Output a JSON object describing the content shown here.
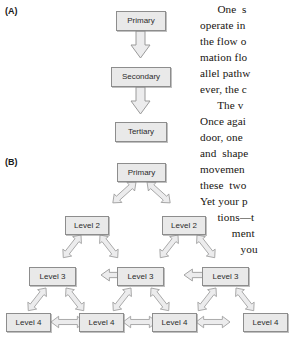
{
  "figure": {
    "panels": [
      {
        "id": "A",
        "label": "(A)"
      },
      {
        "id": "B",
        "label": "(B)"
      }
    ]
  },
  "panel_a": {
    "label": "(A)",
    "type": "serial-hierarchy-flowchart",
    "nodes": [
      {
        "id": "a-primary",
        "label": "Primary"
      },
      {
        "id": "a-secondary",
        "label": "Secondary"
      },
      {
        "id": "a-tertiary",
        "label": "Tertiary"
      }
    ],
    "connectors": [
      {
        "id": "a-arrow-1",
        "from": "a-primary",
        "to": "a-secondary",
        "style": "single-headed-down-block-arrow"
      },
      {
        "id": "a-arrow-2",
        "from": "a-secondary",
        "to": "a-tertiary",
        "style": "single-headed-down-block-arrow"
      }
    ]
  },
  "panel_b": {
    "label": "(B)",
    "type": "distributed-hierarchy-network",
    "nodes": [
      {
        "id": "b-primary",
        "label": "Primary"
      },
      {
        "id": "b-l2-left",
        "label": "Level 2"
      },
      {
        "id": "b-l2-right",
        "label": "Level 2"
      },
      {
        "id": "b-l3-left",
        "label": "Level 3"
      },
      {
        "id": "b-l3-mid",
        "label": "Level 3"
      },
      {
        "id": "b-l3-right",
        "label": "Level 3"
      },
      {
        "id": "b-l4-1",
        "label": "Level 4"
      },
      {
        "id": "b-l4-2",
        "label": "Level 4"
      },
      {
        "id": "b-l4-3",
        "label": "Level 4"
      },
      {
        "id": "b-l4-4",
        "label": "Level 4"
      }
    ],
    "connectors": [
      {
        "id": "b-arrow-p-l2l",
        "from": "b-primary",
        "to": "b-l2-left",
        "style": "double-headed-block-arrow"
      },
      {
        "id": "b-arrow-p-l2r",
        "from": "b-primary",
        "to": "b-l2-right",
        "style": "double-headed-block-arrow"
      },
      {
        "id": "b-arrow-l2l-l3l",
        "from": "b-l2-left",
        "to": "b-l3-left",
        "style": "double-headed-block-arrow"
      },
      {
        "id": "b-arrow-l2l-l3m",
        "from": "b-l2-left",
        "to": "b-l3-mid",
        "style": "double-headed-block-arrow"
      },
      {
        "id": "b-arrow-l2r-l3m",
        "from": "b-l2-right",
        "to": "b-l3-mid",
        "style": "double-headed-block-arrow"
      },
      {
        "id": "b-arrow-l2r-l3r",
        "from": "b-l2-right",
        "to": "b-l3-right",
        "style": "double-headed-block-arrow"
      },
      {
        "id": "b-arrow-l3l-l3m",
        "from": "b-l3-left",
        "to": "b-l3-mid",
        "style": "double-headed-block-arrow"
      },
      {
        "id": "b-arrow-l3m-l3r",
        "from": "b-l3-mid",
        "to": "b-l3-right",
        "style": "double-headed-block-arrow"
      },
      {
        "id": "b-arrow-l3l-l41",
        "from": "b-l3-left",
        "to": "b-l4-1",
        "style": "double-headed-block-arrow"
      },
      {
        "id": "b-arrow-l3l-l42",
        "from": "b-l3-left",
        "to": "b-l4-2",
        "style": "double-headed-block-arrow"
      },
      {
        "id": "b-arrow-l3m-l42",
        "from": "b-l3-mid",
        "to": "b-l4-2",
        "style": "double-headed-block-arrow"
      },
      {
        "id": "b-arrow-l3m-l43",
        "from": "b-l3-mid",
        "to": "b-l4-3",
        "style": "double-headed-block-arrow"
      },
      {
        "id": "b-arrow-l3r-l43",
        "from": "b-l3-right",
        "to": "b-l4-3",
        "style": "double-headed-block-arrow"
      },
      {
        "id": "b-arrow-l3r-l44",
        "from": "b-l3-right",
        "to": "b-l4-4",
        "style": "double-headed-block-arrow"
      },
      {
        "id": "b-arrow-l41-l42",
        "from": "b-l4-1",
        "to": "b-l4-2",
        "style": "double-headed-block-arrow"
      },
      {
        "id": "b-arrow-l42-l43",
        "from": "b-l4-2",
        "to": "b-l4-3",
        "style": "double-headed-block-arrow"
      },
      {
        "id": "b-arrow-l43-l44",
        "from": "b-l4-3",
        "to": "b-l4-4",
        "style": "double-headed-block-arrow"
      }
    ]
  },
  "body_text": {
    "note": "right-hand body-text column, clipped at the right page edge",
    "lines": [
      "      One  s",
      "operate in",
      "the flow o",
      "mation flo",
      "allel pathw",
      "ever, the c",
      "      The v",
      "Once agai",
      "door, one",
      "and  shape",
      "movemen",
      "these  two",
      "Yet your p",
      "      tions—t",
      "           ment",
      "              you"
    ]
  },
  "colors": {
    "box_fill": "#e9e9e9",
    "box_border": "#8d8d8d",
    "box_text": "#2b2b2b",
    "arrow_fill": "#ececed",
    "arrow_border": "#9a9a9a",
    "body_text": "#17140f",
    "page_background": "#ffffff"
  }
}
